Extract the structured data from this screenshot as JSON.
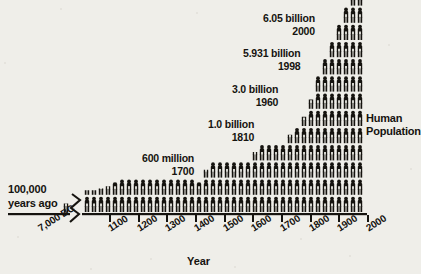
{
  "figure": {
    "title_right": {
      "line1": "Human",
      "line2": "Population"
    },
    "axis_title": "Year",
    "left_note": {
      "line1": "100,000",
      "line2": "years ago"
    },
    "background_color": "#efeee9",
    "ink_color": "#15130f"
  },
  "annotations": [
    {
      "id": "a-1700",
      "value": "600 million",
      "year": "1700",
      "x": 142,
      "y": 152
    },
    {
      "id": "a-1810",
      "value": "1.0 billion",
      "year": "1810",
      "x": 208,
      "y": 118
    },
    {
      "id": "a-1960",
      "value": "3.0 billion",
      "year": "1960",
      "x": 232,
      "y": 83
    },
    {
      "id": "a-1998",
      "value": "5.931 billion",
      "year": "1998",
      "x": 243,
      "y": 47
    },
    {
      "id": "a-2000",
      "value": "6.05 billion",
      "year": "2000",
      "x": 263,
      "y": 12
    }
  ],
  "x_axis": {
    "break_after": "7,000 BC",
    "tick_labels": [
      "7,000 BC",
      "1100",
      "1200",
      "1300",
      "1400",
      "1500",
      "1600",
      "1700",
      "1800",
      "1900",
      "2000"
    ],
    "tick_x": [
      66,
      110,
      139,
      167,
      196,
      225,
      253,
      282,
      311,
      339,
      368
    ]
  },
  "chart_data": {
    "type": "bar",
    "title": "Human Population",
    "xlabel": "Year",
    "ylabel": "Human Population",
    "unit": "each icon represents a share of total human population",
    "axis_break": true,
    "grid": false,
    "legend": false,
    "categories": [
      "7,000 BC",
      "1000",
      "1030",
      "1060",
      "1090",
      "1100",
      "1130",
      "1160",
      "1190",
      "1220",
      "1250",
      "1280",
      "1310",
      "1340",
      "1370",
      "1400",
      "1430",
      "1460",
      "1490",
      "1520",
      "1550",
      "1580",
      "1610",
      "1640",
      "1670",
      "1700",
      "1730",
      "1760",
      "1790",
      "1820",
      "1850",
      "1880",
      "1910",
      "1940",
      "1970",
      "2000"
    ],
    "values": [
      1,
      1,
      1,
      1,
      1,
      2,
      2,
      2,
      2,
      2,
      2,
      2,
      2,
      2,
      2,
      2,
      2,
      2,
      2,
      2,
      2,
      2,
      3,
      3,
      3,
      3,
      4,
      4,
      5,
      6,
      7,
      8,
      9,
      10,
      12,
      14
    ],
    "ylim": [
      0,
      14
    ],
    "milestones": [
      {
        "year": "7,000 BC",
        "population": "~5 million",
        "note": "100,000 years ago marker at far left"
      },
      {
        "year": "1700",
        "population": "600 million"
      },
      {
        "year": "1810",
        "population": "1.0 billion"
      },
      {
        "year": "1960",
        "population": "3.0 billion"
      },
      {
        "year": "1998",
        "population": "5.931 billion"
      },
      {
        "year": "2000",
        "population": "6.05 billion"
      }
    ],
    "columns": [
      {
        "x": 66,
        "full": 0,
        "partial": 0.55
      },
      {
        "x": 87,
        "full": 1,
        "partial": 0.3
      },
      {
        "x": 94,
        "full": 1,
        "partial": 0.3
      },
      {
        "x": 101,
        "full": 1,
        "partial": 0.4
      },
      {
        "x": 108,
        "full": 1,
        "partial": 0.55
      },
      {
        "x": 115,
        "full": 1,
        "partial": 0.8
      },
      {
        "x": 122,
        "full": 2,
        "partial": 0
      },
      {
        "x": 129,
        "full": 2,
        "partial": 0
      },
      {
        "x": 136,
        "full": 2,
        "partial": 0
      },
      {
        "x": 143,
        "full": 2,
        "partial": 0
      },
      {
        "x": 150,
        "full": 2,
        "partial": 0
      },
      {
        "x": 157,
        "full": 2,
        "partial": 0
      },
      {
        "x": 164,
        "full": 2,
        "partial": 0
      },
      {
        "x": 171,
        "full": 2,
        "partial": 0
      },
      {
        "x": 178,
        "full": 2,
        "partial": 0
      },
      {
        "x": 185,
        "full": 2,
        "partial": 0
      },
      {
        "x": 192,
        "full": 2,
        "partial": 0
      },
      {
        "x": 199,
        "full": 1,
        "partial": 0.8
      },
      {
        "x": 206,
        "full": 2,
        "partial": 0.5
      },
      {
        "x": 213,
        "full": 3,
        "partial": 0
      },
      {
        "x": 220,
        "full": 3,
        "partial": 0
      },
      {
        "x": 227,
        "full": 3,
        "partial": 0
      },
      {
        "x": 234,
        "full": 3,
        "partial": 0
      },
      {
        "x": 241,
        "full": 3,
        "partial": 0
      },
      {
        "x": 248,
        "full": 3,
        "partial": 0
      },
      {
        "x": 255,
        "full": 3,
        "partial": 0.55
      },
      {
        "x": 262,
        "full": 4,
        "partial": 0
      },
      {
        "x": 269,
        "full": 4,
        "partial": 0
      },
      {
        "x": 276,
        "full": 4,
        "partial": 0
      },
      {
        "x": 283,
        "full": 4,
        "partial": 0
      },
      {
        "x": 290,
        "full": 4,
        "partial": 0.55
      },
      {
        "x": 297,
        "full": 5,
        "partial": 0
      },
      {
        "x": 304,
        "full": 5,
        "partial": 0.6
      },
      {
        "x": 311,
        "full": 6,
        "partial": 0.6
      },
      {
        "x": 318,
        "full": 8,
        "partial": 0
      },
      {
        "x": 325,
        "full": 9,
        "partial": 0
      },
      {
        "x": 332,
        "full": 10,
        "partial": 0
      },
      {
        "x": 339,
        "full": 11,
        "partial": 0
      },
      {
        "x": 346,
        "full": 12,
        "partial": 0
      },
      {
        "x": 353,
        "full": 13,
        "partial": 0
      },
      {
        "x": 360,
        "full": 14,
        "partial": 0
      }
    ]
  }
}
